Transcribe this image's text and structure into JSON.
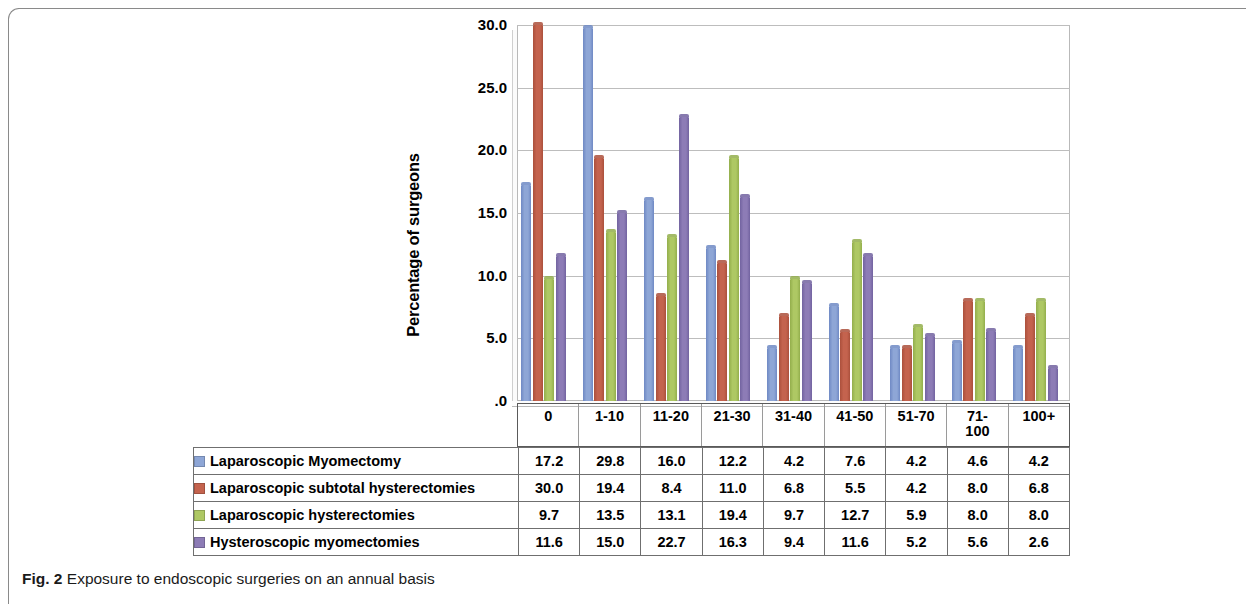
{
  "figure": {
    "caption_prefix": "Fig. 2",
    "caption_text": " Exposure to endoscopic surgeries on an annual basis"
  },
  "chart_data": {
    "type": "bar",
    "title": "",
    "xlabel": "",
    "ylabel": "Percentage of surgeons",
    "ylim": [
      0,
      30
    ],
    "ytick_labels": [
      "30.0",
      "25.0",
      "20.0",
      "15.0",
      "10.0",
      "5.0",
      ".0"
    ],
    "yticks": [
      30,
      25,
      20,
      15,
      10,
      5,
      0
    ],
    "grid": true,
    "legend_position": "bottom-table",
    "categories": [
      "0",
      "1-10",
      "11-20",
      "21-30",
      "31-40",
      "41-50",
      "51-70",
      "71-100",
      "100+"
    ],
    "category_display": [
      "0",
      "1-10",
      "11-20",
      "21-30",
      "31-40",
      "41-50",
      "51-70",
      "71-\n100",
      "100+"
    ],
    "series": [
      {
        "name": "Laparoscopic Myomectomy",
        "color": "#8EA6D6",
        "values": [
          17.2,
          29.8,
          16.0,
          12.2,
          4.2,
          7.6,
          4.2,
          4.6,
          4.2
        ]
      },
      {
        "name": "Laparoscopic subtotal hysterectomies",
        "color": "#C4634E",
        "values": [
          30.0,
          19.4,
          8.4,
          11.0,
          6.8,
          5.5,
          4.2,
          8.0,
          6.8
        ]
      },
      {
        "name": "Laparoscopic hysterectomies",
        "color": "#A7C martin",
        "values": [
          9.7,
          13.5,
          13.1,
          19.4,
          9.7,
          12.7,
          5.9,
          8.0,
          8.0
        ]
      },
      {
        "name": "Hysteroscopic myomectomies",
        "color": "#8D7CB6",
        "values": [
          11.6,
          15.0,
          22.7,
          16.3,
          9.4,
          11.6,
          5.2,
          5.6,
          2.6
        ]
      }
    ]
  }
}
